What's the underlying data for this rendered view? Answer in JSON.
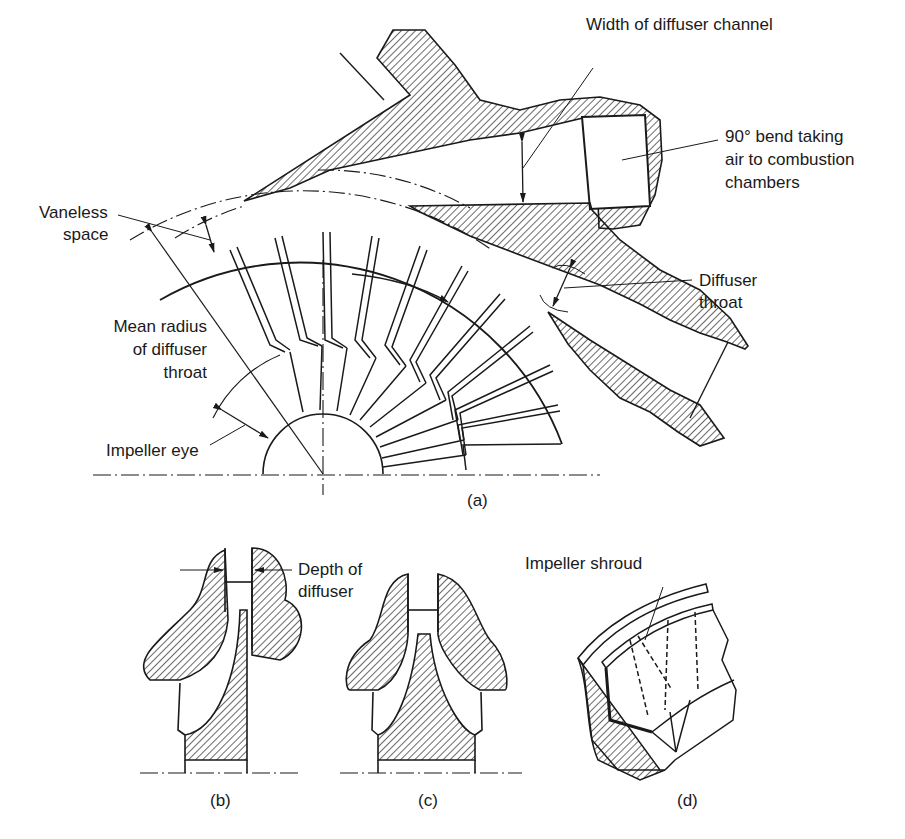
{
  "figure": {
    "panel_a": {
      "caption": "(a)",
      "labels": {
        "width_of_diffuser_channel": "Width of diffuser channel",
        "bend_line1": "90° bend taking",
        "bend_line2": "air to combustion",
        "bend_line3": "chambers",
        "vaneless_line1": "Vaneless",
        "vaneless_line2": "space",
        "diffuser_throat_line1": "Diffuser",
        "diffuser_throat_line2": "throat",
        "mean_radius_line1": "Mean radius",
        "mean_radius_line2": "of diffuser",
        "mean_radius_line3": "throat",
        "impeller_eye": "Impeller eye"
      }
    },
    "panel_b": {
      "caption": "(b)",
      "labels": {
        "depth_line1": "Depth of",
        "depth_line2": "diffuser"
      }
    },
    "panel_c": {
      "caption": "(c)"
    },
    "panel_d": {
      "caption": "(d)",
      "labels": {
        "impeller_shroud": "Impeller shroud"
      }
    },
    "colors": {
      "ink": "#1a1a1a",
      "paper": "#ffffff"
    }
  }
}
